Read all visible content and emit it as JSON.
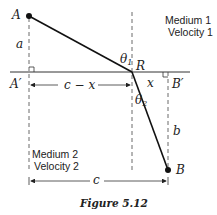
{
  "points": {
    "A": "A",
    "B": "B",
    "R": "R",
    "A_prime": "A′",
    "B_prime": "B′"
  },
  "labels": {
    "a": "a",
    "b": "b",
    "x": "x",
    "c_minus_x": "c − x",
    "c": "c",
    "theta1": "θ",
    "theta1_sub": "1",
    "theta2": "θ",
    "theta2_sub": "2"
  },
  "medium1": {
    "line1": "Medium 1",
    "line2": "Velocity 1"
  },
  "medium2": {
    "line1": "Medium 2",
    "line2": "Velocity 2"
  },
  "caption": "Figure 5.12"
}
